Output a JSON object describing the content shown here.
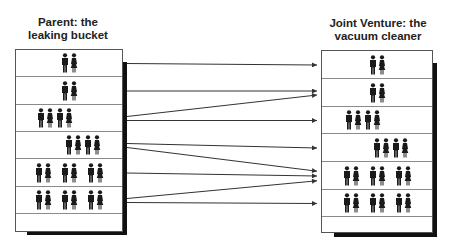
{
  "left": {
    "title_line1": "Parent: the",
    "title_line2": "leaking bucket",
    "rows": [
      {
        "pairs": 1,
        "align": "center"
      },
      {
        "pairs": 1,
        "align": "center"
      },
      {
        "pairs": 2,
        "align": "center-left"
      },
      {
        "pairs": 2,
        "align": "center-right"
      },
      {
        "pairs": 3,
        "align": "center"
      },
      {
        "pairs": 3,
        "align": "center"
      },
      {
        "pairs": 0,
        "align": "center"
      }
    ]
  },
  "right": {
    "title_line1": "Joint Venture: the",
    "title_line2": "vacuum cleaner",
    "rows": [
      {
        "pairs": 1,
        "align": "center"
      },
      {
        "pairs": 1,
        "align": "center"
      },
      {
        "pairs": 2,
        "align": "center-left"
      },
      {
        "pairs": 2,
        "align": "center-right"
      },
      {
        "pairs": 3,
        "align": "center"
      },
      {
        "pairs": 3,
        "align": "center"
      },
      {
        "pairs": 0,
        "align": "center"
      }
    ]
  },
  "icons": {
    "man": "man-icon",
    "woman": "woman-icon"
  },
  "arrows": [
    {
      "from_row": 1,
      "to_row": 1
    },
    {
      "from_row": 2,
      "to_row": 2
    },
    {
      "from_row": 3,
      "to_row": 2
    },
    {
      "from_row": 3,
      "to_row": 3
    },
    {
      "from_row": 4,
      "to_row": 4
    },
    {
      "from_row": 4,
      "to_row": 5
    },
    {
      "from_row": 5,
      "to_row": 5
    },
    {
      "from_row": 6,
      "to_row": 5
    },
    {
      "from_row": 6,
      "to_row": 6
    }
  ]
}
